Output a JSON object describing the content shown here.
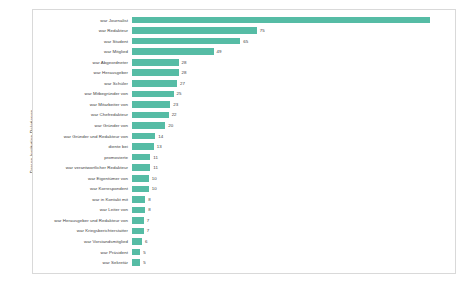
{
  "chart_data": {
    "type": "bar",
    "orientation": "horizontal",
    "title": "",
    "xlabel": "",
    "ylabel": "Person-Institution-Relationen",
    "grid": false,
    "legend": false,
    "xlim": [
      0,
      179
    ],
    "bar_color": "#56BCA5",
    "categories": [
      "war Journalist",
      "war Redakteur",
      "war Student",
      "war Mitglied",
      "war Abgeordneter",
      "war Herausgeber",
      "war Schüler",
      "war Mitbegründer von",
      "war Mitarbeiter von",
      "war Chefredakteur",
      "war Gründer von",
      "war Gründer und Redakteur von",
      "diente bei",
      "promovierte",
      "war verantwortlicher Redakteur",
      "war Eigentümer von",
      "war Korrespondent",
      "war in Kontakt mit",
      "war Leiter von",
      "war Herausgeber und Redakteur von",
      "war Kriegsberichterstatter",
      "war Vorstandsmitglied",
      "war Präsident",
      "war Sekretär"
    ],
    "values": [
      179,
      75,
      65,
      49,
      28,
      28,
      27,
      25,
      23,
      22,
      20,
      14,
      13,
      11,
      11,
      10,
      10,
      8,
      8,
      7,
      7,
      6,
      5,
      5
    ]
  }
}
